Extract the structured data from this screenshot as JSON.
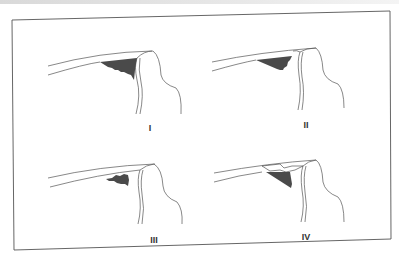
{
  "figure": {
    "panels": [
      {
        "label": "I",
        "type": "wedge-full"
      },
      {
        "label": "II",
        "type": "wedge-partial"
      },
      {
        "label": "III",
        "type": "wedge-detached"
      },
      {
        "label": "IV",
        "type": "wedge-with-flap"
      }
    ],
    "colors": {
      "outline": "#555555",
      "fill": "#4a4a4a",
      "frame": "#555555"
    }
  }
}
